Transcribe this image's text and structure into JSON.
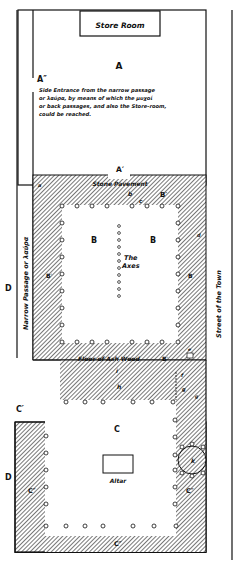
{
  "diagram": {
    "type": "architectural-floor-plan",
    "colors": {
      "line": "#111111",
      "hatch": "#555555",
      "background": "#ffffff"
    },
    "rooms": {
      "store_room": "Store Room",
      "A": "A",
      "A_double_prime": "A″",
      "A_prime": "A′",
      "B_left": "B",
      "B_right": "B",
      "B_prime_top": "B′",
      "B_prime_left": "B′",
      "B_prime_right": "B′",
      "B_prime_bottom": "B′",
      "C": "C",
      "C_prime": "C′",
      "C_dprime_left": "C″",
      "C_dprime_right": "C″",
      "C_dprime_bottom": "C″",
      "D_upper": "D",
      "D_lower": "D"
    },
    "annotations": {
      "side_entrance": [
        "Side Entrance from the narrow passage",
        "or λαύρα, by means of which the μυχοί",
        "or back passages, and also the Store-room,",
        "could be reached."
      ],
      "stone_pavement": "Stone Pavement",
      "the_axes_1": "The",
      "the_axes_2": "Axes",
      "floor_ash_wood": "Floor of Ash Wood",
      "altar": "Altar",
      "narrow_passage": "Narrow Passage or λαύρα",
      "street": "Street of the Town"
    },
    "small_letters": {
      "a": "a",
      "b": "b",
      "c": "c",
      "d": "d",
      "e": "e",
      "f": "f",
      "g1": "g",
      "g2": "g",
      "h": "h",
      "i": "i",
      "k": "k"
    }
  }
}
